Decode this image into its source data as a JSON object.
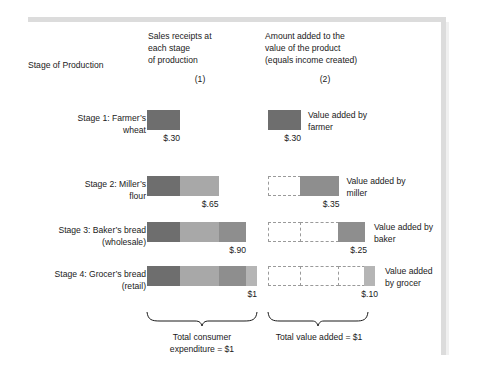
{
  "figure": {
    "header": {
      "stage_column": "Stage of Production",
      "column1": "Sales receipts at\neach stage\nof production",
      "column1_number": "(1)",
      "column2": "Amount added to the\nvalue of the product\n(equals income created)",
      "column2_number": "(2)"
    },
    "rows": [
      {
        "stage_label": "Stage 1: Farmer’s\nwheat",
        "receipts_amount": "$.30",
        "value_added_amount": "$.30",
        "value_added_caption": "Value added by\nfarmer",
        "receipt_segments": [
          {
            "label": "farmer",
            "value": 0.3,
            "color": "#6e6e6e"
          }
        ],
        "empty_boxes": 0,
        "added_segment": {
          "label": "farmer",
          "value": 0.3,
          "color": "#6e6e6e"
        }
      },
      {
        "stage_label": "Stage 2: Miller’s\nflour",
        "receipts_amount": "$.65",
        "value_added_amount": "$.35",
        "value_added_caption": "Value added by\nmiller",
        "receipt_segments": [
          {
            "label": "farmer",
            "value": 0.3,
            "color": "#6e6e6e"
          },
          {
            "label": "miller",
            "value": 0.35,
            "color": "#a8a8a8"
          }
        ],
        "empty_boxes": 1,
        "added_segment": {
          "label": "miller",
          "value": 0.35,
          "color": "#8e8e8e"
        }
      },
      {
        "stage_label": "Stage 3: Baker’s bread\n(wholesale)",
        "receipts_amount": "$.90",
        "value_added_amount": "$.25",
        "value_added_caption": "Value added by\nbaker",
        "receipt_segments": [
          {
            "label": "farmer",
            "value": 0.3,
            "color": "#6e6e6e"
          },
          {
            "label": "miller",
            "value": 0.35,
            "color": "#a8a8a8"
          },
          {
            "label": "baker",
            "value": 0.25,
            "color": "#8e8e8e"
          }
        ],
        "empty_boxes": 2,
        "added_segment": {
          "label": "baker",
          "value": 0.25,
          "color": "#8e8e8e"
        }
      },
      {
        "stage_label": "Stage 4: Grocer’s bread\n(retail)",
        "receipts_amount": "$1",
        "value_added_amount": "$.10",
        "value_added_caption": "Value added\nby grocer",
        "receipt_segments": [
          {
            "label": "farmer",
            "value": 0.3,
            "color": "#6e6e6e"
          },
          {
            "label": "miller",
            "value": 0.35,
            "color": "#a8a8a8"
          },
          {
            "label": "baker",
            "value": 0.25,
            "color": "#8e8e8e"
          },
          {
            "label": "grocer",
            "value": 0.1,
            "color": "#b5b5b5"
          }
        ],
        "empty_boxes": 3,
        "added_segment": {
          "label": "grocer",
          "value": 0.1,
          "color": "#b5b5b5"
        }
      }
    ],
    "totals": {
      "column1": "Total consumer\nexpenditure = $1",
      "column2": "Total value added = $1"
    },
    "colors": {
      "farmer": "#6e6e6e",
      "miller": "#a8a8a8",
      "baker": "#8e8e8e",
      "grocer": "#b5b5b5",
      "frame": "#dcdcdc",
      "dash_border": "#9a9a9a",
      "text": "#1a1a1a"
    }
  },
  "chart_data": {
    "type": "bar",
    "categories": [
      "Stage 1: Farmer’s wheat",
      "Stage 2: Miller’s flour",
      "Stage 3: Baker’s bread (wholesale)",
      "Stage 4: Grocer’s bread (retail)"
    ],
    "series": [
      {
        "name": "Sales receipts at each stage of production (1)",
        "values": [
          0.3,
          0.65,
          0.9,
          1.0
        ],
        "labels": [
          "$.30",
          "$.65",
          "$.90",
          "$1"
        ]
      },
      {
        "name": "Amount added to the value of the product (2)",
        "values": [
          0.3,
          0.35,
          0.25,
          0.1
        ],
        "labels": [
          "$.30",
          "$.35",
          "$.25",
          "$.10"
        ]
      }
    ],
    "stacked_components": [
      {
        "name": "Value added by farmer",
        "value": 0.3,
        "color": "#6e6e6e"
      },
      {
        "name": "Value added by miller",
        "value": 0.35,
        "color": "#a8a8a8"
      },
      {
        "name": "Value added by baker",
        "value": 0.25,
        "color": "#8e8e8e"
      },
      {
        "name": "Value added by grocer",
        "value": 0.1,
        "color": "#b5b5b5"
      }
    ],
    "annotations": [
      "Total consumer expenditure = $1",
      "Total value added = $1"
    ],
    "xlabel": "Stage of Production",
    "ylabel": "Dollars",
    "ylim": [
      0,
      1
    ],
    "grid": false,
    "legend": "right"
  }
}
